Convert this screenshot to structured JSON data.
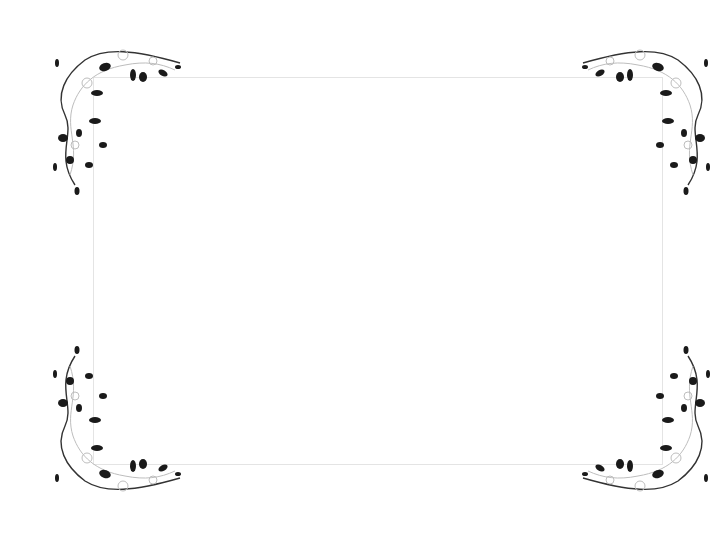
{
  "image": {
    "description": "Blank certificate-style frame with floral vine corner ornaments",
    "background_color": "#ffffff",
    "frame_border_color": "#e4e4e4",
    "ornament_color": "#1a1a1a",
    "swirl_color": "#bdbdbd",
    "corners": [
      {
        "position": "top-left",
        "icon": "floral-vine-icon"
      },
      {
        "position": "top-right",
        "icon": "floral-vine-icon"
      },
      {
        "position": "bottom-left",
        "icon": "floral-vine-icon"
      },
      {
        "position": "bottom-right",
        "icon": "floral-vine-icon"
      }
    ]
  }
}
